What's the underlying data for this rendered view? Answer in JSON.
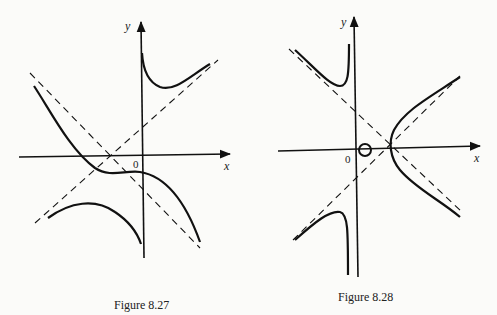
{
  "figures": [
    {
      "id": "fig-8-27",
      "caption": "Figure 8.27",
      "x_axis_label": "x",
      "y_axis_label": "y",
      "origin_label": "0"
    },
    {
      "id": "fig-8-28",
      "caption": "Figure 8.28",
      "x_axis_label": "x",
      "y_axis_label": "y",
      "origin_label": "0"
    }
  ]
}
